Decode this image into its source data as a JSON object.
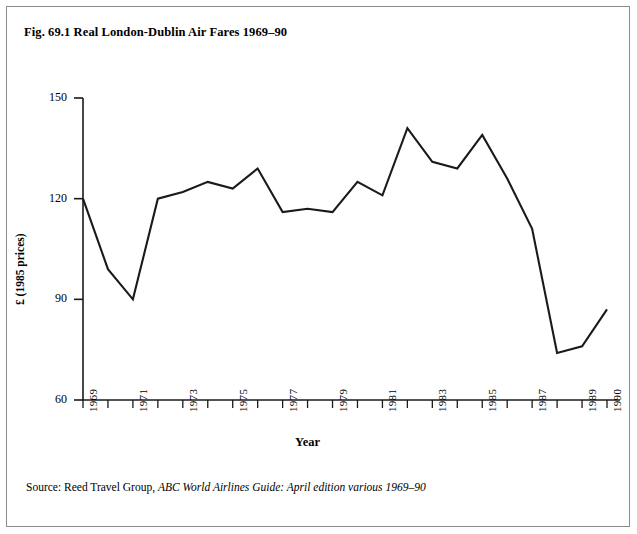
{
  "figure": {
    "title": "Fig. 69.1 Real London-Dublin Air Fares 1969–90",
    "source_prefix": "Source: Reed Travel Group, ",
    "source_italic": "ABC World Airlines Guide: April edition various 1969–90"
  },
  "chart_data": {
    "type": "line",
    "title": "Fig. 69.1 Real London-Dublin Air Fares 1969–90",
    "xlabel": "Year",
    "ylabel": "£ (1985 prices)",
    "xlim": [
      1969,
      1990
    ],
    "ylim": [
      60,
      150
    ],
    "yticks": [
      60,
      90,
      120,
      150
    ],
    "ytick_labels": [
      "60",
      "90",
      "120",
      "150"
    ],
    "xticks": [
      1969,
      1970,
      1971,
      1972,
      1973,
      1974,
      1975,
      1976,
      1977,
      1978,
      1979,
      1980,
      1981,
      1982,
      1983,
      1984,
      1985,
      1986,
      1987,
      1988,
      1989,
      1990
    ],
    "xtick_labels": [
      "1969",
      "",
      "1971",
      "",
      "1973",
      "",
      "1975",
      "",
      "1977",
      "",
      "1979",
      "",
      "1981",
      "",
      "1983",
      "",
      "1985",
      "",
      "1987",
      "",
      "1989",
      "1990"
    ],
    "grid": false,
    "legend": false,
    "line_color": "#1a1a1a",
    "line_width": 2.1,
    "x": [
      1969,
      1970,
      1971,
      1972,
      1973,
      1974,
      1975,
      1976,
      1977,
      1978,
      1979,
      1980,
      1981,
      1982,
      1983,
      1984,
      1985,
      1986,
      1987,
      1988,
      1989,
      1990
    ],
    "values": [
      120,
      99,
      90,
      120,
      122,
      125,
      123,
      129,
      116,
      117,
      116,
      125,
      121,
      141,
      131,
      129,
      139,
      126,
      111,
      74,
      76,
      87
    ],
    "series": [
      {
        "name": "Real London-Dublin air fare",
        "values": [
          120,
          99,
          90,
          120,
          122,
          125,
          123,
          129,
          116,
          117,
          116,
          125,
          121,
          141,
          131,
          129,
          139,
          126,
          111,
          74,
          76,
          87
        ]
      }
    ]
  }
}
